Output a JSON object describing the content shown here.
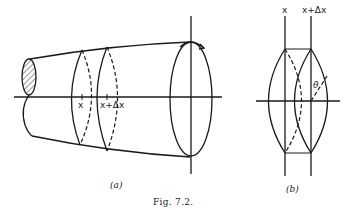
{
  "figure": {
    "caption": "Fig. 7.2.",
    "panel_a": {
      "label": "(a)",
      "x_label": "x",
      "x_dx_label": "x+Δx"
    },
    "panel_b": {
      "label": "(b)",
      "x_label": "x",
      "x_dx_label": "x+Δx",
      "angle_label": "θ"
    }
  }
}
